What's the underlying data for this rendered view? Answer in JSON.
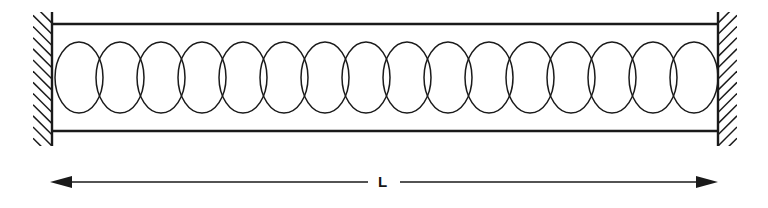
{
  "figure": {
    "type": "mechanical-diagram",
    "canvas": {
      "width": 768,
      "height": 208,
      "background": "#ffffff"
    },
    "stroke_color": "#1a1a1a",
    "label_color": "#151515",
    "elements": {
      "left_wall": {
        "name": "left-fixed-support",
        "x": 52,
        "y_top": 12,
        "y_bottom": 146,
        "hatch_side": "left",
        "hatch_width": 19,
        "hatch_count": 13,
        "line_width": 2.4
      },
      "right_wall": {
        "name": "right-fixed-support",
        "x": 718,
        "y_top": 12,
        "y_bottom": 146,
        "hatch_side": "right",
        "hatch_width": 19,
        "hatch_count": 13,
        "line_width": 2.4
      },
      "top_beam": {
        "name": "top-guide-rail",
        "x_start": 52,
        "x_end": 718,
        "y": 24,
        "line_width": 2.6
      },
      "bottom_beam": {
        "name": "bottom-guide-rail",
        "x_start": 52,
        "x_end": 718,
        "y": 131,
        "line_width": 2.6
      },
      "spring": {
        "name": "helical-spring",
        "x_start": 55,
        "x_end": 718,
        "y_top": 42,
        "y_bottom": 113,
        "coil_count": 16,
        "coil_width": 48,
        "coil_pitch": 41.4,
        "line_width": 1.5
      },
      "dimension": {
        "name": "length-dimension",
        "label": "L",
        "x_start": 50,
        "x_end": 718,
        "y": 182,
        "label_x": 378,
        "label_y": 174,
        "arrowhead_length": 22,
        "arrowhead_half_height": 6,
        "line_width": 1.6,
        "gap_half_width": 16
      }
    }
  },
  "labels": {
    "length": "L"
  }
}
